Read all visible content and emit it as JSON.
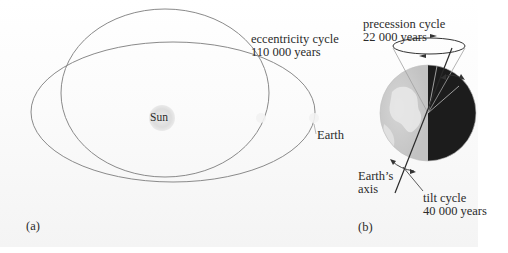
{
  "figure": {
    "panel_a": {
      "label": "(a)",
      "sun_label": "Sun",
      "earth_label": "Earth",
      "eccentricity": {
        "line1": "eccentricity cycle",
        "line2": "110 000 years"
      }
    },
    "panel_b": {
      "label": "(b)",
      "precession": {
        "line1": "precession cycle",
        "line2": "22 000 years"
      },
      "axis": {
        "line1": "Earth’s",
        "line2": "axis"
      },
      "tilt": {
        "line1": "tilt cycle",
        "line2": "40 000 years"
      }
    },
    "colors": {
      "orbit": "#8a8a8a",
      "sun": "#dcdcdc",
      "earth_day": "#c9c9c9",
      "earth_night": "#1c1c1c",
      "text": "#2b2b2b"
    }
  }
}
